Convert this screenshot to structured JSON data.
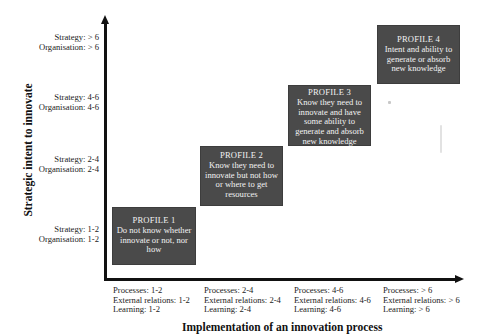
{
  "diagram": {
    "y_axis_title": "Strategic intent to innovate",
    "x_axis_title": "Implementation of an innovation process",
    "y_levels": [
      {
        "strategy": "Strategy: > 6",
        "organisation": "Organisation: > 6"
      },
      {
        "strategy": "Strategy: 4-6",
        "organisation": "Organisation: 4-6"
      },
      {
        "strategy": "Strategy: 2-4",
        "organisation": "Organisation: 2-4"
      },
      {
        "strategy": "Strategy: 1-2",
        "organisation": "Organisation: 1-2"
      }
    ],
    "x_levels": [
      {
        "processes": "Processes: 1-2",
        "external": "External relations: 1-2",
        "learning": "Learning: 1-2"
      },
      {
        "processes": "Processes: 2-4",
        "external": "External relations: 2-4",
        "learning": "Learning: 2-4"
      },
      {
        "processes": "Processes: 4-6",
        "external": "External relations: 4-6",
        "learning": "Learning: 4-6"
      },
      {
        "processes": "Processes: > 6",
        "external": "External relations: > 6",
        "learning": "Learning:  > 6"
      }
    ],
    "profiles": [
      {
        "title": "PROFILE 1",
        "lines": [
          "Do not know whether",
          "innovate or not, nor",
          "how"
        ]
      },
      {
        "title": "PROFILE 2",
        "lines": [
          "Know they need to",
          "innovate but not how",
          "or where to get",
          "resources"
        ]
      },
      {
        "title": "PROFILE 3",
        "lines": [
          "Know they need to",
          "innovate and have",
          "some ability to",
          "generate and absorb",
          "new knowledge"
        ]
      },
      {
        "title": "PROFILE 4",
        "lines": [
          "Intent and ability to",
          "generate or absorb",
          "new knowledge"
        ]
      }
    ],
    "colors": {
      "box_fill": "#4a4a4a",
      "box_text": "#f2f2f2",
      "axis": "#111111"
    }
  }
}
